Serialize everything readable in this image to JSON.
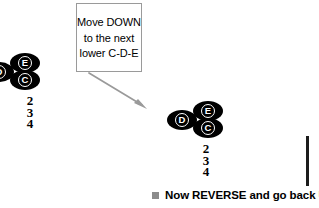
{
  "callout": {
    "lines": [
      "Move DOWN",
      "to the next",
      "lower C-D-E"
    ],
    "line1": "Move DOWN",
    "line2": "to the next",
    "line3": "lower C-D-E",
    "border_color": "#9a9a9a"
  },
  "arrow": {
    "name": "down-right-arrow",
    "color": "#9a9a9a",
    "direction": "down-right"
  },
  "clusters": [
    {
      "id": "left",
      "notes": [
        {
          "label": "D",
          "position": "left"
        },
        {
          "label": "E",
          "position": "upper-right"
        },
        {
          "label": "C",
          "position": "lower-right"
        }
      ],
      "fingering": [
        "2",
        "3",
        "4"
      ]
    },
    {
      "id": "right",
      "notes": [
        {
          "label": "D",
          "position": "left"
        },
        {
          "label": "E",
          "position": "upper-right"
        },
        {
          "label": "C",
          "position": "lower-right"
        }
      ],
      "fingering": [
        "2",
        "3",
        "4"
      ]
    }
  ],
  "cluster_left": {
    "note_d": "D",
    "note_e": "E",
    "note_c": "C",
    "finger1": "2",
    "finger2": "3",
    "finger3": "4"
  },
  "cluster_right": {
    "note_d": "D",
    "note_e": "E",
    "note_c": "C",
    "finger1": "2",
    "finger2": "3",
    "finger3": "4"
  },
  "caption": {
    "bullet": "square-bullet",
    "text": "Now REVERSE and go back UP",
    "bullet_color": "#8c8c8c"
  },
  "right_rule": {
    "name": "vertical-rule",
    "color": "#1c1c1c"
  },
  "colors": {
    "note_fill": "#000000",
    "note_label": "#ffffff",
    "background": "#ffffff",
    "accent_gray": "#9a9a9a"
  }
}
